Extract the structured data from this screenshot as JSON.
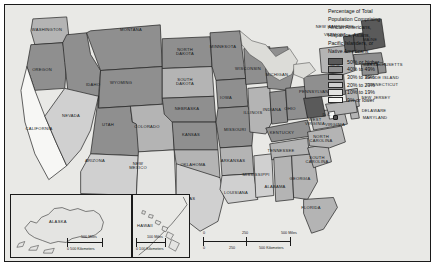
{
  "map": {
    "title": "United States minority population choropleth map",
    "legend": {
      "title": "Percentage of Total Population Comprising African Americans, Hispanics, Asians, Pacific Islanders, or Native Americans",
      "title_lines": [
        "Percentage of Total",
        "Population Comprising",
        "African Americans,",
        "Hispanics, Asians,",
        "Pacific Islanders, or",
        "Native Americans"
      ],
      "entries": [
        {
          "label": "50% or higher",
          "color": "#5a5a5a",
          "min": 50,
          "max": 100
        },
        {
          "label": "40% to 49%",
          "color": "#8f8f8f",
          "min": 40,
          "max": 49
        },
        {
          "label": "30% to 39%",
          "color": "#b4b4b4",
          "min": 30,
          "max": 39
        },
        {
          "label": "20% to 29%",
          "color": "#d0d0d0",
          "min": 20,
          "max": 29
        },
        {
          "label": "10% to 19%",
          "color": "#e4e4e2",
          "min": 10,
          "max": 19
        },
        {
          "label": "9% or lower",
          "color": "#f7f7f5",
          "min": 0,
          "max": 9
        }
      ]
    },
    "scale_bars": [
      {
        "name": "main",
        "miles": [
          "0",
          "250",
          "500 Miles"
        ],
        "kilometers": [
          "0",
          "250",
          "500 Kilometers"
        ]
      },
      {
        "name": "alaska",
        "miles": [
          "0",
          "500 Miles"
        ],
        "kilometers": [
          "0",
          "500 Kilometers"
        ]
      },
      {
        "name": "hawaii",
        "miles": [
          "0",
          "100 Miles"
        ],
        "kilometers": [
          "0",
          "100 Kilometers"
        ]
      }
    ],
    "insets": [
      {
        "name": "alaska",
        "label": "ALASKA"
      },
      {
        "name": "hawaii",
        "label": "HAWAII"
      }
    ],
    "states": [
      {
        "name": "WASHINGTON",
        "label": "WASHINGTON",
        "bucket": 2,
        "x": 42,
        "y": 27
      },
      {
        "name": "OREGON",
        "label": "OREGON",
        "bucket": 1,
        "x": 37,
        "y": 67
      },
      {
        "name": "CALIFORNIA",
        "label": "CALIFORNIA",
        "bucket": 5,
        "x": 34,
        "y": 126
      },
      {
        "name": "IDAHO",
        "label": "IDAHO",
        "bucket": 1,
        "x": 88,
        "y": 82
      },
      {
        "name": "NEVADA",
        "label": "NEVADA",
        "bucket": 3,
        "x": 66,
        "y": 113
      },
      {
        "name": "MONTANA",
        "label": "MONTANA",
        "bucket": 1,
        "x": 126,
        "y": 27
      },
      {
        "name": "WYOMING",
        "label": "WYOMING",
        "bucket": 1,
        "x": 116,
        "y": 80
      },
      {
        "name": "UTAH",
        "label": "UTAH",
        "bucket": 1,
        "x": 103,
        "y": 122
      },
      {
        "name": "ARIZONA",
        "label": "ARIZONA",
        "bucket": 3,
        "x": 90,
        "y": 158
      },
      {
        "name": "COLORADO",
        "label": "COLORADO",
        "bucket": 2,
        "x": 142,
        "y": 124
      },
      {
        "name": "NEW MEXICO",
        "label": "NEW\nMEXICO",
        "bucket": 4,
        "x": 133,
        "y": 161
      },
      {
        "name": "NORTH DAKOTA",
        "label": "NORTH\nDAKOTA",
        "bucket": 1,
        "x": 180,
        "y": 47
      },
      {
        "name": "SOUTH DAKOTA",
        "label": "SOUTH\nDAKOTA",
        "bucket": 2,
        "x": 180,
        "y": 77
      },
      {
        "name": "NEBRASKA",
        "label": "NEBRASKA",
        "bucket": 1,
        "x": 182,
        "y": 106
      },
      {
        "name": "KANSAS",
        "label": "KANSAS",
        "bucket": 1,
        "x": 186,
        "y": 132
      },
      {
        "name": "OKLAHOMA",
        "label": "OKLAHOMA",
        "bucket": 2,
        "x": 188,
        "y": 162
      },
      {
        "name": "TEXAS",
        "label": "TEXAS",
        "bucket": 3,
        "x": 183,
        "y": 196
      },
      {
        "name": "MINNESOTA",
        "label": "MINNESOTA",
        "bucket": 1,
        "x": 218,
        "y": 44
      },
      {
        "name": "IOWA",
        "label": "IOWA",
        "bucket": 1,
        "x": 221,
        "y": 95
      },
      {
        "name": "MISSOURI",
        "label": "MISSOURI",
        "bucket": 1,
        "x": 230,
        "y": 127
      },
      {
        "name": "ARKANSAS",
        "label": "ARKANSAS",
        "bucket": 2,
        "x": 228,
        "y": 158
      },
      {
        "name": "LOUISIANA",
        "label": "LOUISIANA",
        "bucket": 3,
        "x": 231,
        "y": 190
      },
      {
        "name": "WISCONSIN",
        "label": "WISCONSIN",
        "bucket": 1,
        "x": 243,
        "y": 66
      },
      {
        "name": "ILLINOIS",
        "label": "ILLINOIS",
        "bucket": 2,
        "x": 248,
        "y": 110
      },
      {
        "name": "MISSISSIPPI",
        "label": "MISSISSIPPI",
        "bucket": 3,
        "x": 251,
        "y": 172
      },
      {
        "name": "MICHIGAN",
        "label": "MICHIGAN",
        "bucket": 1,
        "x": 272,
        "y": 72
      },
      {
        "name": "INDIANA",
        "label": "INDIANA",
        "bucket": 1,
        "x": 267,
        "y": 107
      },
      {
        "name": "OHIO",
        "label": "OHIO",
        "bucket": 1,
        "x": 285,
        "y": 106
      },
      {
        "name": "KENTUCKY",
        "label": "KENTUCKY",
        "bucket": 1,
        "x": 277,
        "y": 130
      },
      {
        "name": "TENNESSEE",
        "label": "TENNESSEE",
        "bucket": 2,
        "x": 276,
        "y": 148
      },
      {
        "name": "ALABAMA",
        "label": "ALABAMA",
        "bucket": 2,
        "x": 270,
        "y": 184
      },
      {
        "name": "GEORGIA",
        "label": "GEORGIA",
        "bucket": 2,
        "x": 295,
        "y": 176
      },
      {
        "name": "FLORIDA",
        "label": "FLORIDA",
        "bucket": 2,
        "x": 306,
        "y": 205
      },
      {
        "name": "SOUTH CAROLINA",
        "label": "SOUTH\nCAROLINA",
        "bucket": 2,
        "x": 312,
        "y": 155
      },
      {
        "name": "NORTH CAROLINA",
        "label": "NORTH\nCAROLINA",
        "bucket": 2,
        "x": 316,
        "y": 134
      },
      {
        "name": "VIRGINIA",
        "label": "VIRGINIA",
        "bucket": 2,
        "x": 330,
        "y": 122
      },
      {
        "name": "WEST VIRGINIA",
        "label": "WEST\nVIRGINIA",
        "bucket": 0,
        "x": 310,
        "y": 117
      },
      {
        "name": "PENNSYLVANIA",
        "label": "PENNSYLVANIA",
        "bucket": 1,
        "x": 311,
        "y": 89
      },
      {
        "name": "NEW YORK",
        "label": "NEW\nYORK",
        "bucket": 2,
        "x": 330,
        "y": 62
      },
      {
        "name": "VERMONT",
        "label": "VERMONT",
        "bucket": 0,
        "x": 330,
        "y": 32
      },
      {
        "name": "NEW HAMPSHIRE",
        "label": "NEW HAMPSHIRE",
        "bucket": 0,
        "x": 330,
        "y": 24
      },
      {
        "name": "MAINE",
        "label": "MAINE",
        "bucket": 0,
        "x": 365,
        "y": 37
      },
      {
        "name": "MASSACHUSETTS",
        "label": "MASSACHUSETTS",
        "bucket": 1,
        "x": 378,
        "y": 62
      },
      {
        "name": "RHODE ISLAND",
        "label": "RHODE ISLAND",
        "bucket": 1,
        "x": 377,
        "y": 75
      },
      {
        "name": "CONNECTICUT",
        "label": "CONNECTICUT",
        "bucket": 1,
        "x": 377,
        "y": 82
      },
      {
        "name": "NEW JERSEY",
        "label": "NEW JERSEY",
        "bucket": 2,
        "x": 371,
        "y": 95
      },
      {
        "name": "DELAWARE",
        "label": "DELAWARE",
        "bucket": 2,
        "x": 369,
        "y": 108
      },
      {
        "name": "MARYLAND",
        "label": "MARYLAND",
        "bucket": 2,
        "x": 370,
        "y": 115
      },
      {
        "name": "D.C.",
        "label": "D.C.",
        "bucket": 5,
        "x": 322,
        "y": 112
      }
    ]
  }
}
